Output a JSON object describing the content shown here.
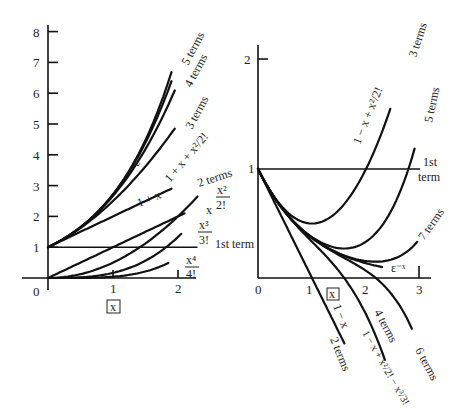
{
  "chart_data": [
    {
      "type": "line",
      "title": "Taylor polynomial approximations of e^x",
      "xlabel": "x",
      "ylabel": "",
      "xlim": [
        0,
        2.3
      ],
      "ylim": [
        0,
        8
      ],
      "x_ticks": [
        "0",
        "1",
        "2"
      ],
      "y_ticks": [
        "1",
        "2",
        "3",
        "4",
        "5",
        "6",
        "7",
        "8"
      ],
      "series": [
        {
          "name": "e^x",
          "label": "εˣ",
          "expr": "exp",
          "x_range": [
            0,
            1.9
          ]
        },
        {
          "name": "5 terms",
          "expr": "t5",
          "x_range": [
            0,
            1.9
          ]
        },
        {
          "name": "4 terms",
          "expr": "t4",
          "x_range": [
            0,
            1.95
          ]
        },
        {
          "name": "3 terms",
          "label": "1 + x + x²/2!",
          "expr": "t3",
          "x_range": [
            0,
            1.95
          ]
        },
        {
          "name": "2 terms",
          "label": "1 + x",
          "expr": "t2",
          "x_range": [
            0,
            1.9
          ]
        },
        {
          "name": "1st term",
          "expr": "one",
          "x_range": [
            0,
            2.3
          ]
        },
        {
          "name": "x",
          "expr": "x",
          "x_range": [
            0,
            2.1
          ]
        },
        {
          "name": "x²/2!",
          "expr": "x2",
          "x_range": [
            0,
            2.3
          ]
        },
        {
          "name": "x³/3!",
          "expr": "x3",
          "x_range": [
            0,
            2.05
          ]
        },
        {
          "name": "x⁴/4!",
          "expr": "x4",
          "x_range": [
            0,
            1.85
          ]
        }
      ]
    },
    {
      "type": "line",
      "title": "Taylor polynomial approximations of e^-x",
      "xlabel": "x",
      "ylabel": "",
      "xlim": [
        0,
        3.2
      ],
      "ylim": [
        0,
        2
      ],
      "x_ticks": [
        "0",
        "1",
        "2",
        "3"
      ],
      "y_ticks": [
        "1",
        "2"
      ],
      "series": [
        {
          "name": "1st term",
          "expr": "one",
          "x_range": [
            0,
            3.0
          ]
        },
        {
          "name": "2 terms",
          "label": "1 − x",
          "expr": "m2",
          "x_range": [
            0,
            1.6
          ]
        },
        {
          "name": "3 terms",
          "label": "1 − x + x²/2!",
          "expr": "m3",
          "x_range": [
            0,
            2.45
          ]
        },
        {
          "name": "4 terms",
          "label": "1 − x + x²/2! − x³/3!",
          "expr": "m4",
          "x_range": [
            0,
            2.35
          ]
        },
        {
          "name": "5 terms",
          "expr": "m5",
          "x_range": [
            0,
            2.9
          ]
        },
        {
          "name": "6 terms",
          "expr": "m6",
          "x_range": [
            0,
            2.85
          ]
        },
        {
          "name": "7 terms",
          "expr": "m7",
          "x_range": [
            0,
            2.95
          ]
        },
        {
          "name": "e^-x",
          "label": "ε⁻ˣ",
          "expr": "mexp",
          "x_range": [
            0,
            2.3
          ]
        }
      ]
    }
  ],
  "left": {
    "zero": "0",
    "x_axis_box": "x",
    "ticks_y": [
      "1",
      "2",
      "3",
      "4",
      "5",
      "6",
      "7",
      "8"
    ],
    "ticks_x": [
      "1",
      "2"
    ],
    "labels": {
      "five_terms": "5 terms",
      "four_terms": "4 terms",
      "three_terms": "3 terms",
      "ex": "εˣ",
      "three_expr": "1 + x + x²/2!",
      "two_terms": "2 terms",
      "one_plus_x": "1 + x",
      "x_sq_num": "x²",
      "x_sq_den": "2!",
      "x": "x",
      "x_cu_num": "x³",
      "x_cu_den": "3!",
      "first_term": "1st term",
      "x_4_num": "x⁴",
      "x_4_den": "4!"
    }
  },
  "right": {
    "zero": "0",
    "x_axis_box": "x",
    "ticks_y": [
      "1",
      "2"
    ],
    "ticks_x": [
      "1",
      "2",
      "3"
    ],
    "labels": {
      "three_terms": "3 terms",
      "three_expr": "1 − x + x²/2!",
      "five_terms": "5 terms",
      "first": "1st",
      "term": "term",
      "seven_terms": "7 terms",
      "emx": "ε⁻ˣ",
      "one_minus_x": "1 − x",
      "two_terms": "2 terms",
      "four_terms": "4 terms",
      "four_expr": "1 − x + x²/2! − x³/3!",
      "six_terms": "6 terms"
    }
  }
}
